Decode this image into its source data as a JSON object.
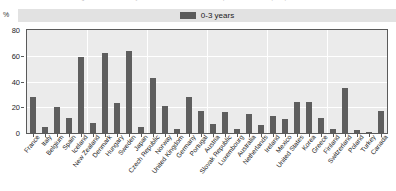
{
  "figure": {
    "percent_symbol": "%",
    "clipped_title": "Percentage of children under 3 years enrolled in formal childcare or pre-school services (2008)"
  },
  "legend": {
    "position": "top-center",
    "entries": [
      {
        "label": "0-3 years",
        "color": "#5e5e5e"
      }
    ]
  },
  "chart_data": {
    "type": "bar",
    "title": "",
    "xlabel": "",
    "ylabel": "%",
    "ylim": [
      0,
      80
    ],
    "yticks": [
      0,
      20,
      40,
      60,
      80
    ],
    "grid": true,
    "legend_position": "top-center",
    "series_name": "0-3 years",
    "series_color": "#5e5e5e",
    "categories": [
      "France",
      "Italy",
      "Belgium",
      "Spain",
      "Iceland",
      "New Zealand",
      "Denmark",
      "Hungary",
      "Sweden",
      "Japan",
      "Czech Republic",
      "Norway",
      "United Kingdom",
      "Germany",
      "Portugal",
      "Austria",
      "Slovak Republic",
      "Luxembourg",
      "Australia",
      "Netherlands",
      "Ireland",
      "Mexico",
      "United States",
      "Korea",
      "Greece",
      "Finland",
      "Switzerland",
      "Poland",
      "Turkey",
      "Canada"
    ],
    "values": [
      28,
      5,
      20,
      12,
      59,
      8,
      62,
      23,
      64,
      5,
      43,
      21,
      3,
      28,
      17,
      7,
      16,
      3,
      15,
      6,
      13,
      11,
      24,
      24,
      12,
      3,
      35,
      2,
      1,
      17
    ]
  }
}
